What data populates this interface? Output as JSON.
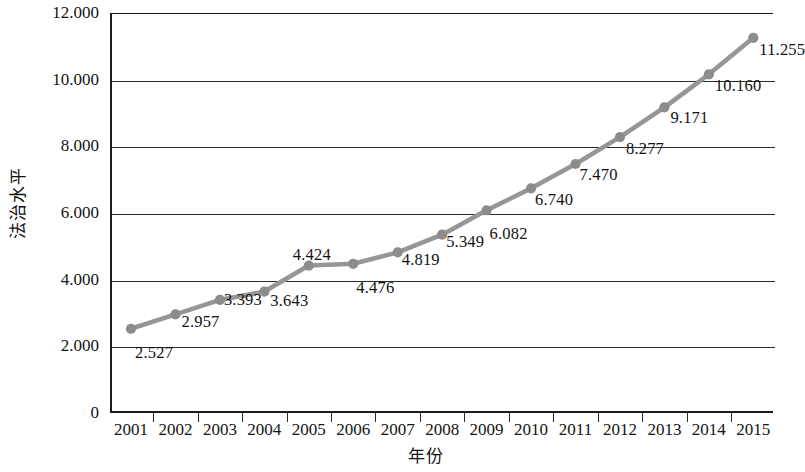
{
  "chart_data": {
    "type": "line",
    "title": "",
    "xlabel": "年份",
    "ylabel": "法治水平",
    "categories": [
      "2001",
      "2002",
      "2003",
      "2004",
      "2005",
      "2006",
      "2007",
      "2008",
      "2009",
      "2010",
      "2011",
      "2012",
      "2013",
      "2014",
      "2015"
    ],
    "values": [
      2.527,
      2.957,
      3.393,
      3.643,
      4.424,
      4.476,
      4.819,
      5.349,
      6.082,
      6.74,
      7.47,
      8.277,
      9.171,
      10.16,
      11.255
    ],
    "point_labels": [
      "2.527",
      "2.957",
      "3.393",
      "3.643",
      "4.424",
      "4.476",
      "4.819",
      "5.349",
      "6.082",
      "6.740",
      "7.470",
      "8.277",
      "9.171",
      "10.160",
      "11.255"
    ],
    "ylim": [
      0,
      12
    ],
    "ytick_labels": [
      "0",
      "2.000",
      "4.000",
      "6.000",
      "8.000",
      "10.000",
      "12.000"
    ],
    "ytick_values": [
      0,
      2,
      4,
      6,
      8,
      10,
      12
    ],
    "grid": "horizontal",
    "legend": "none",
    "series": [
      {
        "name": "法治水平",
        "values": [
          2.527,
          2.957,
          3.393,
          3.643,
          4.424,
          4.476,
          4.819,
          5.349,
          6.082,
          6.74,
          7.47,
          8.277,
          9.171,
          10.16,
          11.255
        ],
        "line_color": "#969696",
        "marker_color": "#8c8c8c",
        "marker": "circle"
      }
    ]
  },
  "colors": {
    "line": "#969696",
    "marker": "#8c8c8c",
    "axis": "#1c1c1c",
    "grid": "#2b2b2b",
    "text": "#141414",
    "background": "#ffffff"
  }
}
